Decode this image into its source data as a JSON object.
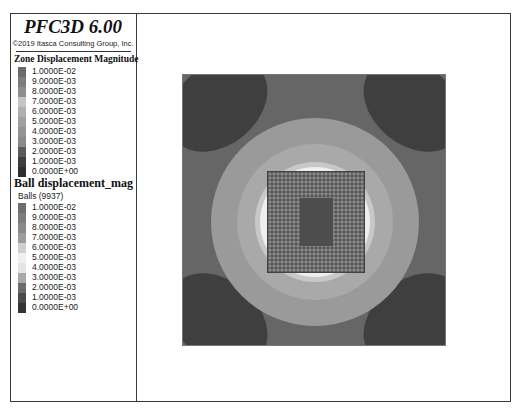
{
  "header": {
    "app_title": "PFC3D 6.00",
    "copyright": "©2019 Itasca Consulting Group, Inc."
  },
  "zone_legend": {
    "title": "Zone Displacement Magnitude",
    "entries": [
      {
        "label": "1.0000E-02",
        "color": "#6a6a6a"
      },
      {
        "label": "9.0000E-03",
        "color": "#7d7d7d"
      },
      {
        "label": "8.0000E-03",
        "color": "#8e8e8e"
      },
      {
        "label": "7.0000E-03",
        "color": "#c4c4c4"
      },
      {
        "label": "6.0000E-03",
        "color": "#b0b0b0"
      },
      {
        "label": "5.0000E-03",
        "color": "#a0a0a0"
      },
      {
        "label": "4.0000E-03",
        "color": "#939393"
      },
      {
        "label": "3.0000E-03",
        "color": "#8a8a8a"
      },
      {
        "label": "2.0000E-03",
        "color": "#5a5a5a"
      },
      {
        "label": "1.0000E-03",
        "color": "#3e3e3e"
      },
      {
        "label": "0.0000E+00",
        "color": "#2e2e2e"
      }
    ]
  },
  "ball_legend": {
    "title": "Ball displacement_mag",
    "subtitle": "Balls (9937)",
    "entries": [
      {
        "label": "1.0000E-02",
        "color": "#6e6e6e"
      },
      {
        "label": "9.0000E-03",
        "color": "#7c7c7c"
      },
      {
        "label": "8.0000E-03",
        "color": "#8a8a8a"
      },
      {
        "label": "7.0000E-03",
        "color": "#9c9c9c"
      },
      {
        "label": "6.0000E-03",
        "color": "#cfcfcf"
      },
      {
        "label": "5.0000E-03",
        "color": "#f0f0f0"
      },
      {
        "label": "4.0000E-03",
        "color": "#e4e4e4"
      },
      {
        "label": "3.0000E-03",
        "color": "#a8a8a8"
      },
      {
        "label": "2.0000E-03",
        "color": "#6a6a6a"
      },
      {
        "label": "1.0000E-03",
        "color": "#4a4a4a"
      },
      {
        "label": "0.0000E+00",
        "color": "#333333"
      }
    ]
  },
  "plot": {
    "background": "#666666",
    "corner_color": "#3f3f3f",
    "rings": [
      {
        "radius": 104,
        "color": "#9a9a9a"
      },
      {
        "radius": 78,
        "color": "#a9a9a9"
      },
      {
        "radius": 60,
        "color": "#c8c8c8"
      },
      {
        "radius": 55,
        "color": "#eeeeee"
      }
    ],
    "balls_color": "#6e6e6e",
    "inner_rect_color": "#4d4d4d"
  }
}
